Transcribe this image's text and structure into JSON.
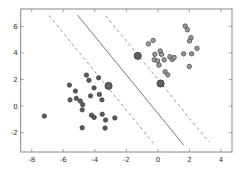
{
  "chart_data": {
    "type": "scatter",
    "title": "",
    "xlabel": "",
    "ylabel": "",
    "xlim": [
      -8.7,
      4.7
    ],
    "ylim": [
      -3.45,
      7.3
    ],
    "grid": false,
    "legend": "none",
    "xticks": [
      -8,
      -6,
      -4,
      -2,
      0,
      2,
      4
    ],
    "xtick_labels": [
      "-8",
      "-6",
      "-4",
      "-2",
      "0",
      "2",
      "4"
    ],
    "yticks": [
      -2,
      0,
      2,
      4,
      6
    ],
    "ytick_labels": [
      "-2",
      "0",
      "2",
      "4",
      "6"
    ],
    "series": [
      {
        "name": "class 0",
        "color": "#5a5a5a",
        "points": [
          [
            -7.2,
            -0.75
          ],
          [
            -4.53,
            2.33
          ],
          [
            -4.37,
            1.94
          ],
          [
            -3.76,
            2.13
          ],
          [
            -5.61,
            1.58
          ],
          [
            -5.23,
            1.13
          ],
          [
            -4.05,
            1.37
          ],
          [
            -3.71,
            0.88
          ],
          [
            -4.27,
            0.77
          ],
          [
            -5.57,
            0.47
          ],
          [
            -5.17,
            0.58
          ],
          [
            -4.92,
            0.38
          ],
          [
            -4.77,
            0.1
          ],
          [
            -3.55,
            0.47
          ],
          [
            -4.8,
            -0.28
          ],
          [
            -4.21,
            -0.68
          ],
          [
            -4.04,
            -0.85
          ],
          [
            -3.53,
            -0.61
          ],
          [
            -3.32,
            -1.05
          ],
          [
            -2.73,
            -0.89
          ],
          [
            -4.8,
            -1.63
          ],
          [
            -3.35,
            -1.65
          ]
        ]
      },
      {
        "name": "class 1",
        "color": "#9a9a9a",
        "points": [
          [
            1.73,
            6.02
          ],
          [
            1.87,
            5.74
          ],
          [
            2.1,
            5.14
          ],
          [
            2.01,
            4.89
          ],
          [
            2.48,
            4.34
          ],
          [
            -0.6,
            4.68
          ],
          [
            -0.3,
            4.94
          ],
          [
            0.15,
            4.14
          ],
          [
            -0.19,
            3.89
          ],
          [
            0.23,
            3.89
          ],
          [
            -0.23,
            3.48
          ],
          [
            -0.02,
            3.4
          ],
          [
            0.07,
            3.08
          ],
          [
            0.4,
            3.48
          ],
          [
            0.76,
            3.71
          ],
          [
            0.91,
            3.5
          ],
          [
            1.03,
            3.65
          ],
          [
            1.63,
            3.93
          ],
          [
            2.14,
            3.93
          ],
          [
            1.99,
            2.98
          ],
          [
            0.46,
            2.58
          ],
          [
            0.63,
            2.35
          ]
        ]
      },
      {
        "name": "support vectors",
        "color": "#5f5f5f",
        "points": [
          [
            -3.13,
            1.52
          ],
          [
            -1.28,
            3.78
          ],
          [
            0.17,
            1.7
          ]
        ]
      }
    ],
    "lines": [
      {
        "name": "decision boundary",
        "style": "solid",
        "color": "#777777",
        "slope": -1.45,
        "intercept": -0.55,
        "x_range": [
          -5.1,
          1.65
        ]
      },
      {
        "name": "lower margin",
        "style": "dashed",
        "color": "#999999",
        "slope": -1.45,
        "intercept": -3.2,
        "x_range": [
          -6.9,
          -0.27
        ]
      },
      {
        "name": "upper margin",
        "style": "dashed",
        "color": "#999999",
        "slope": -1.45,
        "intercept": 2.0,
        "x_range": [
          -3.3,
          3.24
        ]
      }
    ]
  }
}
